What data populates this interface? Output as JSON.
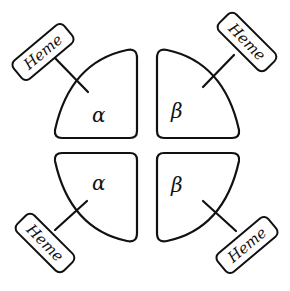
{
  "diagram": {
    "subunits": [
      {
        "position": "top-left",
        "label": "α",
        "name": "alpha"
      },
      {
        "position": "top-right",
        "label": "β",
        "name": "beta"
      },
      {
        "position": "bottom-left",
        "label": "α",
        "name": "alpha"
      },
      {
        "position": "bottom-right",
        "label": "β",
        "name": "beta"
      }
    ],
    "heme_tags": [
      {
        "position": "top-left",
        "label": "Heme"
      },
      {
        "position": "top-right",
        "label": "Heme"
      },
      {
        "position": "bottom-left",
        "label": "Heme"
      },
      {
        "position": "bottom-right",
        "label": "Heme"
      }
    ],
    "colors": {
      "stroke": "#111111",
      "background": "#ffffff"
    }
  }
}
